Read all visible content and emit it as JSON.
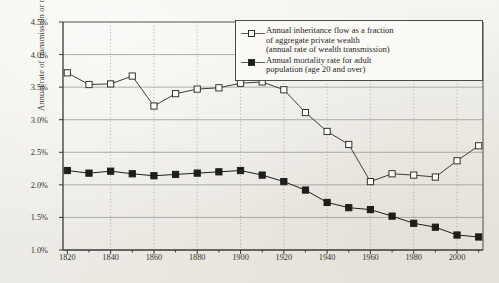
{
  "chart_data": {
    "type": "line",
    "title": "",
    "xlabel": "",
    "ylabel": "Annual rate of transmission or mortality (%)",
    "xlim": [
      1818,
      2012
    ],
    "ylim": [
      1.0,
      4.5
    ],
    "ytick_values": [
      4.5,
      4.0,
      3.5,
      3.0,
      2.5,
      2.0,
      1.5,
      1.0
    ],
    "ytick_labels": [
      "4.5%",
      "4.0%",
      "3.5%",
      "3.0%",
      "2.5%",
      "2.0%",
      "1.5%",
      "1.0%"
    ],
    "xtick_values": [
      1820,
      1840,
      1860,
      1880,
      1900,
      1920,
      1940,
      1960,
      1980,
      2000
    ],
    "xtick_labels": [
      "1820",
      "1840",
      "1860",
      "1880",
      "1900",
      "1920",
      "1940",
      "1960",
      "1980",
      "2000"
    ],
    "grid": "both",
    "legend_position": "top-right",
    "x": [
      1820,
      1830,
      1840,
      1850,
      1860,
      1870,
      1880,
      1890,
      1900,
      1910,
      1920,
      1930,
      1940,
      1950,
      1960,
      1970,
      1980,
      1990,
      2000,
      2010
    ],
    "series": [
      {
        "name": "inheritance_flow",
        "marker": "open-square",
        "color": "#3c3c38",
        "values": [
          3.72,
          3.54,
          3.55,
          3.67,
          3.21,
          3.4,
          3.47,
          3.49,
          3.56,
          3.58,
          3.46,
          3.11,
          2.82,
          2.62,
          2.05,
          2.17,
          2.15,
          2.12,
          2.37,
          2.6
        ]
      },
      {
        "name": "mortality_rate",
        "marker": "filled-square",
        "color": "#1d1d1a",
        "values": [
          2.22,
          2.18,
          2.21,
          2.17,
          2.14,
          2.16,
          2.18,
          2.2,
          2.22,
          2.15,
          2.05,
          1.92,
          1.73,
          1.65,
          1.62,
          1.52,
          1.41,
          1.35,
          1.23,
          1.2
        ]
      }
    ]
  },
  "legend": {
    "entries": [
      {
        "marker": "open-square",
        "lines": [
          "Annual inheritance flow as a fraction",
          "of aggregate private wealth",
          "(annual rate of wealth transmission)"
        ]
      },
      {
        "marker": "filled-square",
        "lines": [
          "Annual mortality rate for adult",
          "population (age 20 and over)"
        ]
      }
    ]
  }
}
